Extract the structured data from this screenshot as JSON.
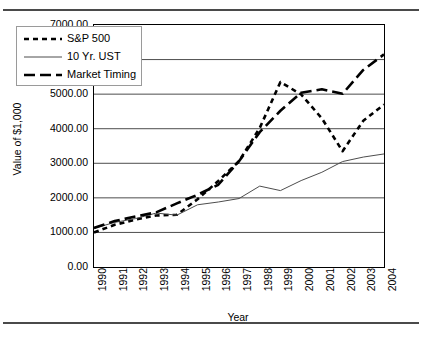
{
  "chart_data": {
    "type": "line",
    "title": "",
    "xlabel": "Year",
    "ylabel": "Value of $1,000",
    "x": [
      1990,
      1991,
      1992,
      1993,
      1994,
      1995,
      1996,
      1997,
      1998,
      1999,
      2000,
      2001,
      2002,
      2003,
      2004
    ],
    "categories": [
      "1990",
      "1991",
      "1992",
      "1993",
      "1994",
      "1995",
      "1996",
      "1997",
      "1998",
      "1999",
      "2000",
      "2001",
      "2002",
      "2003",
      "2004"
    ],
    "xlim": [
      1990,
      2004
    ],
    "ylim": [
      0,
      7000
    ],
    "yticks": [
      0,
      1000,
      2000,
      3000,
      4000,
      5000,
      6000,
      7000
    ],
    "ytick_labels": [
      "0.00",
      "1000.00",
      "2000.00",
      "3000.00",
      "4000.00",
      "5000.00",
      "6000.00",
      "7000.00"
    ],
    "grid": "horizontal",
    "legend_position": "upper-left",
    "series": [
      {
        "name": "S&P 500",
        "style": "short-dash",
        "width": 2.6,
        "color": "#000000",
        "values": [
          1000,
          1220,
          1370,
          1490,
          1510,
          1960,
          2490,
          3060,
          4020,
          5350,
          4990,
          4300,
          3350,
          4230,
          4700
        ]
      },
      {
        "name": "10 Yr. UST",
        "style": "solid-thin",
        "width": 1,
        "color": "#4d4d4d",
        "values": [
          1120,
          1290,
          1400,
          1560,
          1500,
          1800,
          1880,
          1980,
          2340,
          2210,
          2500,
          2740,
          3050,
          3180,
          3270
        ]
      },
      {
        "name": "Market Timing",
        "style": "long-dash",
        "width": 2.6,
        "color": "#000000",
        "values": [
          1130,
          1330,
          1460,
          1580,
          1840,
          2090,
          2380,
          3060,
          3900,
          4520,
          5040,
          5140,
          5010,
          5700,
          6150
        ]
      }
    ]
  },
  "legend": {
    "entries": [
      {
        "label": "S&P 500"
      },
      {
        "label": "10 Yr. UST"
      },
      {
        "label": "Market Timing"
      }
    ]
  }
}
